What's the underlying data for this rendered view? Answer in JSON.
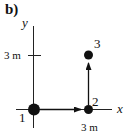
{
  "figure": {
    "panel_label": "b)",
    "axes": {
      "x_label": "x",
      "y_label": "y",
      "y_tick_label": "3 m",
      "x_tick_label": "3 m"
    },
    "points": [
      {
        "id": "1",
        "label": "1",
        "x_m": 0,
        "y_m": 0
      },
      {
        "id": "2",
        "label": "2",
        "x_m": 3,
        "y_m": 0
      },
      {
        "id": "3",
        "label": "3",
        "x_m": 3,
        "y_m": 3
      }
    ],
    "arrows": [
      {
        "from": "1",
        "to": "2"
      },
      {
        "from": "2",
        "to": "3"
      }
    ],
    "colors": {
      "ink": "#111111",
      "background": "#ffffff"
    }
  }
}
